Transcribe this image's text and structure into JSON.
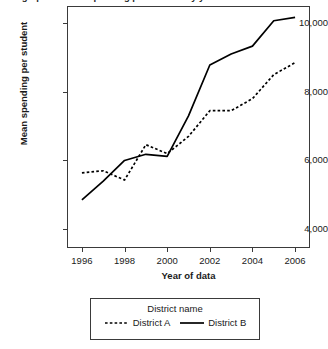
{
  "chart_data": {
    "type": "line",
    "title": "Line graph of mean spending per student by year of data and district name",
    "xlabel": "Year of data",
    "ylabel": "Mean spending per student",
    "x": [
      1996,
      1997,
      1998,
      1999,
      2000,
      2001,
      2002,
      2003,
      2004,
      2005,
      2006
    ],
    "xticks": [
      "1996",
      "1998",
      "2000",
      "2002",
      "2004",
      "2006"
    ],
    "xtick_values": [
      1996,
      1998,
      2000,
      2002,
      2004,
      2006
    ],
    "yticks": [
      "4,000",
      "6,000",
      "8,000",
      "10,000"
    ],
    "ytick_values": [
      4000,
      6000,
      8000,
      10000
    ],
    "xlim": [
      1995.3,
      2006.7
    ],
    "ylim": [
      3450,
      10500
    ],
    "grid": false,
    "legend_position": "bottom",
    "legend_title": "District name",
    "series": [
      {
        "name": "District  A",
        "style": "dotted",
        "color": "#000000",
        "values": [
          5640,
          5700,
          5430,
          6460,
          6200,
          6700,
          7450,
          7450,
          7800,
          8500,
          8850
        ]
      },
      {
        "name": "District  B",
        "style": "solid",
        "color": "#000000",
        "values": [
          4850,
          5400,
          6000,
          6180,
          6120,
          7300,
          8780,
          9100,
          9330,
          10070,
          10170
        ]
      }
    ]
  }
}
